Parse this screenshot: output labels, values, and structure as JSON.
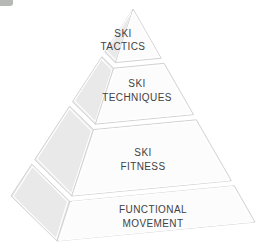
{
  "diagram": {
    "type": "pyramid",
    "levels": [
      {
        "id": "ski-tactics",
        "line1": "SKI",
        "line2": "TACTICS"
      },
      {
        "id": "ski-techniques",
        "line1": "SKI",
        "line2": "TECHNIQUES"
      },
      {
        "id": "ski-fitness",
        "line1": "SKI",
        "line2": "FITNESS"
      },
      {
        "id": "functional-movement",
        "line1": "FUNCTIONAL",
        "line2": "MOVEMENT"
      }
    ],
    "colors": {
      "background": "#ffffff",
      "front_face": "#fcfcfc",
      "side_face": "#e9e9e9",
      "outline": "#d2d2d2",
      "inset_line": "#ffffff",
      "text": "#424242",
      "corner_fragment": "#b5b8b5"
    }
  }
}
